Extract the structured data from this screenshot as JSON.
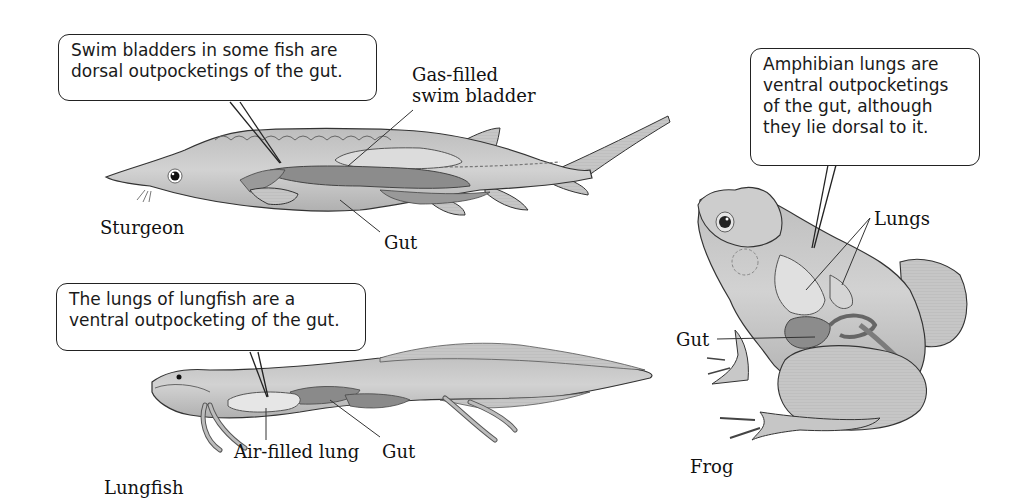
{
  "diagram": {
    "type": "anatomical-comparison",
    "colors": {
      "body_fill": "#c9c9c9",
      "organ_dark": "#8a8a8a",
      "organ_light": "#e6e6e6",
      "outline": "#333333",
      "background": "#ffffff"
    }
  },
  "sturgeon": {
    "name": "Sturgeon",
    "callout": {
      "lines": [
        "Swim bladders in some fish are",
        "dorsal outpocketings of the gut."
      ]
    },
    "labels": {
      "swim_bladder": [
        "Gas-filled",
        "swim bladder"
      ],
      "gut": "Gut"
    }
  },
  "lungfish": {
    "name": "Lungfish",
    "callout": {
      "lines": [
        "The lungs of lungfish are a",
        "ventral outpocketing of the gut."
      ]
    },
    "labels": {
      "lung": "Air-filled lung",
      "gut": "Gut"
    }
  },
  "frog": {
    "name": "Frog",
    "callout": {
      "lines": [
        "Amphibian lungs are",
        "ventral outpocketings",
        "of the gut, although",
        "they lie dorsal to it."
      ]
    },
    "labels": {
      "lungs": "Lungs",
      "gut": "Gut"
    }
  }
}
